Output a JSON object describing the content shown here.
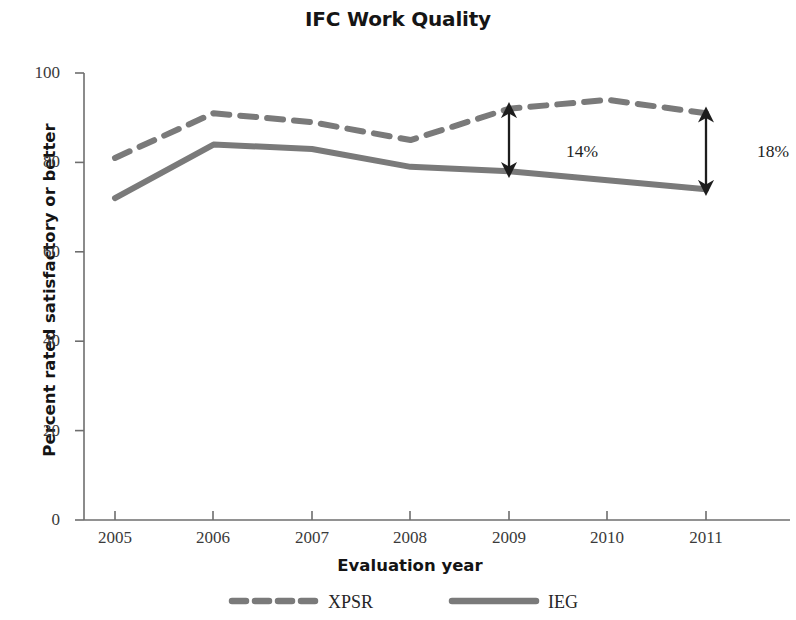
{
  "chart_data": {
    "type": "line",
    "title": "IFC Work Quality",
    "xlabel": "Evaluation year",
    "ylabel": "Percent rated satisfactory or better",
    "x": [
      2005,
      2006,
      2007,
      2008,
      2009,
      2010,
      2011
    ],
    "categories": [
      "2005",
      "2006",
      "2007",
      "2008",
      "2009",
      "2010",
      "2011"
    ],
    "series": [
      {
        "name": "XPSR",
        "style": "dashed",
        "color": "#7a7a7a",
        "values": [
          81,
          91,
          89,
          85,
          92,
          94,
          91
        ]
      },
      {
        "name": "IEG",
        "style": "solid",
        "color": "#7a7a7a",
        "values": [
          72,
          84,
          83,
          79,
          78,
          76,
          74
        ]
      }
    ],
    "ylim": [
      0,
      100
    ],
    "yticks": [
      0,
      20,
      40,
      60,
      80,
      100
    ],
    "ytick_labels": [
      "0",
      "20",
      "40",
      "60",
      "80",
      "100"
    ],
    "xtick_labels": [
      "2005",
      "2006",
      "2007",
      "2008",
      "2009",
      "2010",
      "2011"
    ],
    "grid": false,
    "legend_position": "bottom",
    "annotations": [
      {
        "label": "14%",
        "at_year": "2009",
        "from_value": 78,
        "to_value": 92,
        "arrow": "double-headed"
      },
      {
        "label": "18%",
        "at_year": "2011",
        "from_value": 74,
        "to_value": 91,
        "arrow": "double-headed"
      }
    ]
  },
  "legend": {
    "items": [
      {
        "label": "XPSR",
        "style": "dashed"
      },
      {
        "label": "IEG",
        "style": "solid"
      }
    ]
  },
  "colors": {
    "line": "#7a7a7a",
    "axis": "#6e6e6e",
    "text": "#1a1a1a",
    "annotation": "#1d1d1d",
    "background": "#ffffff"
  }
}
